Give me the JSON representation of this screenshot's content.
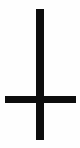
{
  "canvas": {
    "width": 80,
    "height": 148,
    "background_color": "#fefefe"
  },
  "figure": {
    "name": "inverted-cross",
    "title": "Inverted Cross",
    "stroke_color": "#0d0d0d",
    "orientation": "inverted",
    "parts": [
      {
        "name": "vertical-bar",
        "label": "Vertical post",
        "x": 36,
        "y": 9,
        "width": 8,
        "height": 131,
        "color": "#0d0d0d"
      },
      {
        "name": "horizontal-bar",
        "label": "Horizontal crossbar",
        "x": 5,
        "y": 96,
        "width": 71,
        "height": 7,
        "color": "#0d0d0d"
      }
    ],
    "intersection": {
      "label": "Crossing point",
      "x": 40,
      "y": 99
    }
  }
}
